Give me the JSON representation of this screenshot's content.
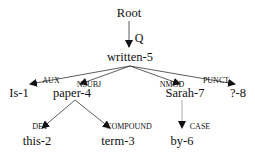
{
  "nodes": {
    "root": "Root",
    "written": "written-5",
    "is": "Is-1",
    "paper": "paper-4",
    "sarah": "Sarah-7",
    "punct": "?-8",
    "this": "this-2",
    "term": "term-3",
    "by": "by-6"
  },
  "edges": {
    "q": "Q",
    "aux": "AUX",
    "nsubj": "NSUBJ",
    "nmod": "NMOD",
    "punct": "PUNCT",
    "det": "DET",
    "compound": "COMPOUND",
    "case": "CASE"
  }
}
